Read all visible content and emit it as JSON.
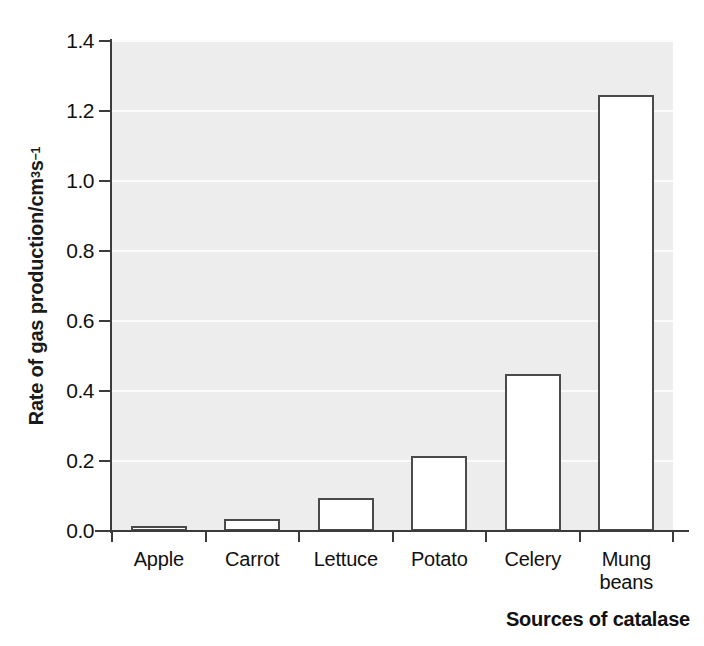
{
  "chart_data": {
    "type": "bar",
    "title": "",
    "categories": [
      "Apple",
      "Carrot",
      "Lettuce",
      "Potato",
      "Celery",
      "Mung beans"
    ],
    "category_labels": [
      [
        "Apple"
      ],
      [
        "Carrot"
      ],
      [
        "Lettuce"
      ],
      [
        "Potato"
      ],
      [
        "Celery"
      ],
      [
        "Mung",
        "beans"
      ]
    ],
    "values": [
      0.015,
      0.035,
      0.095,
      0.215,
      0.45,
      1.245
    ],
    "xlabel": "Sources of catalase",
    "ylabel": "Rate of gas production/cm3 s-1",
    "ylabel_parts": {
      "prefix": "Rate of gas production/cm",
      "sup1": "3",
      "mid": " s",
      "sup2": "−1"
    },
    "ylim": [
      0.0,
      1.4
    ],
    "yticks": [
      0.0,
      0.2,
      0.4,
      0.6,
      0.8,
      1.0,
      1.2,
      1.4
    ],
    "ytick_labels": [
      "0.0",
      "0.2",
      "0.4",
      "0.6",
      "0.8",
      "1.0",
      "1.2",
      "1.4"
    ],
    "grid": "horizontal",
    "legend": "none",
    "bar_fill_color": "#ffffff",
    "bar_edge_color": "#4a4a4a",
    "plot_background_color": "#ededed",
    "gridline_color": "#fbfbfb",
    "axis_color": "#3b3b3b",
    "text_color": "#111111"
  }
}
